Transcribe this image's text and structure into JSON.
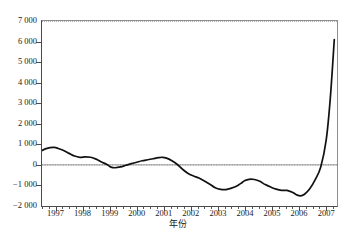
{
  "chart_data": {
    "type": "line",
    "title": "",
    "xlabel": "年份",
    "ylabel": "",
    "xlim": [
      1996.5,
      2007.4
    ],
    "ylim": [
      -2000,
      7000
    ],
    "grid": false,
    "legend": false,
    "zero_line": true,
    "line_color": "#111111",
    "zero_line_color": "#9a9a9a",
    "axis_color": "#4a4a4a",
    "y_ticks": [
      7000,
      6000,
      5000,
      4000,
      3000,
      2000,
      1000,
      0,
      -1000,
      -2000
    ],
    "y_tick_labels": [
      "7 000",
      "6 000",
      "5 000",
      "4 000",
      "3 000",
      "2 000",
      "1 000",
      "0",
      "−1 000",
      "−2 000"
    ],
    "x_ticks": [
      1997,
      1998,
      1999,
      2000,
      2001,
      2002,
      2003,
      2004,
      2005,
      2006,
      2007
    ],
    "x_tick_labels": [
      "1997",
      "1998",
      "1999",
      "2000",
      "2001",
      "2002",
      "2003",
      "2004",
      "2005",
      "2006",
      "2007"
    ],
    "x_minor_tick_step": 0.25,
    "series": [
      {
        "name": "series-1",
        "x": [
          1996.5,
          1996.65,
          1996.8,
          1996.95,
          1997.1,
          1997.3,
          1997.5,
          1997.7,
          1997.9,
          1998.1,
          1998.3,
          1998.5,
          1998.7,
          1998.9,
          1999.05,
          1999.2,
          1999.4,
          1999.6,
          1999.8,
          2000.0,
          2000.2,
          2000.4,
          2000.6,
          2000.8,
          2000.95,
          2001.1,
          2001.3,
          2001.5,
          2001.7,
          2001.9,
          2002.1,
          2002.3,
          2002.5,
          2002.7,
          2002.9,
          2003.1,
          2003.3,
          2003.5,
          2003.7,
          2003.85,
          2004.0,
          2004.15,
          2004.35,
          2004.55,
          2004.75,
          2004.95,
          2005.15,
          2005.35,
          2005.55,
          2005.75,
          2005.9,
          2006.05,
          2006.2,
          2006.4,
          2006.6,
          2006.8,
          2007.0,
          2007.15,
          2007.3
        ],
        "y": [
          700,
          790,
          840,
          850,
          800,
          700,
          560,
          430,
          370,
          390,
          370,
          280,
          140,
          20,
          -110,
          -140,
          -100,
          -20,
          60,
          130,
          200,
          250,
          300,
          350,
          370,
          330,
          200,
          20,
          -220,
          -420,
          -540,
          -640,
          -780,
          -940,
          -1110,
          -1190,
          -1200,
          -1130,
          -1030,
          -900,
          -760,
          -700,
          -710,
          -800,
          -960,
          -1080,
          -1180,
          -1240,
          -1240,
          -1330,
          -1450,
          -1510,
          -1430,
          -1150,
          -700,
          -100,
          1200,
          3200,
          6100
        ]
      }
    ]
  },
  "figure": {
    "caption": ""
  }
}
